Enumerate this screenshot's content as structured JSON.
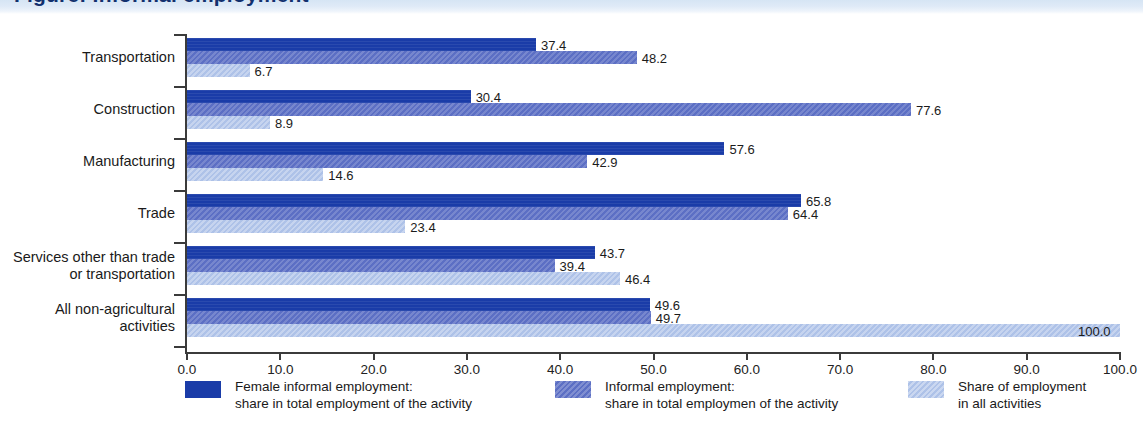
{
  "header": {
    "title_clipped": "Figure: Informal employment",
    "band_color": "#dce8f5"
  },
  "colors": {
    "series_0": "#1a3ca8",
    "series_1": "#5c6fc4",
    "series_2": "#aec2e8",
    "axis": "#3b3b3b",
    "text": "#1a1a1a",
    "background": "#ffffff"
  },
  "legend": [
    {
      "label": "Female informal employment:\nshare in total employment of the activity",
      "color": "#1a3ca8",
      "swatch": "legend-swatch-dark-blue"
    },
    {
      "label": "Informal employment:\nshare in total employmen of the activity",
      "color": "#5c6fc4",
      "swatch": "legend-swatch-medium-blue"
    },
    {
      "label": "Share of employment\nin all activities",
      "color": "#aec2e8",
      "swatch": "legend-swatch-light-blue"
    }
  ],
  "axis": {
    "x_ticks": [
      "0.0",
      "10.0",
      "20.0",
      "30.0",
      "40.0",
      "50.0",
      "60.0",
      "70.0",
      "80.0",
      "90.0",
      "100.0"
    ]
  },
  "chart_data": {
    "type": "bar",
    "orientation": "horizontal",
    "title": "",
    "xlabel": "",
    "ylabel": "",
    "xlim": [
      0,
      100
    ],
    "grid": false,
    "legend_position": "bottom",
    "categories": [
      "Transportation",
      "Construction",
      "Manufacturing",
      "Trade",
      "Services other than trade\nor transportation",
      "All non-agricultural\nactivities"
    ],
    "series": [
      {
        "name": "Female informal employment: share in total employment of the activity",
        "color": "#1a3ca8",
        "values": [
          37.4,
          30.4,
          57.6,
          65.8,
          43.7,
          49.6
        ],
        "labels": [
          "37.4",
          "30.4",
          "57.6",
          "65.8",
          "43.7",
          "49.6"
        ]
      },
      {
        "name": "Informal employment: share in total employmen of the activity",
        "color": "#5c6fc4",
        "values": [
          48.2,
          77.6,
          42.9,
          64.4,
          39.4,
          49.7
        ],
        "labels": [
          "48.2",
          "77.6",
          "42.9",
          "64.4",
          "39.4",
          "49.7"
        ]
      },
      {
        "name": "Share of employment in all activities",
        "color": "#aec2e8",
        "values": [
          6.7,
          8.9,
          14.6,
          23.4,
          46.4,
          100.0
        ],
        "labels": [
          "6.7",
          "8.9",
          "14.6",
          "23.4",
          "46.4",
          "100.0"
        ]
      }
    ]
  }
}
